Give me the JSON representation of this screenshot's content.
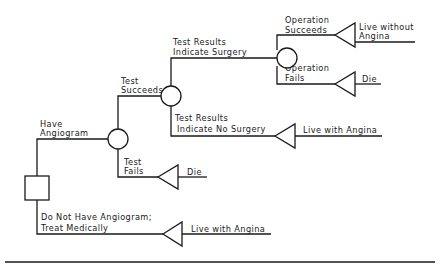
{
  "diagram": {
    "type": "decision-tree",
    "nodes": {
      "decision": {
        "shape": "square",
        "label": ""
      },
      "chance_angiogram": {
        "shape": "circle"
      },
      "chance_test_result": {
        "shape": "circle"
      },
      "chance_operation": {
        "shape": "circle"
      }
    },
    "branches": {
      "have_angiogram": {
        "line1": "Have",
        "line2": "Angiogram"
      },
      "no_angiogram": {
        "line1": "Do Not Have Angiogram;",
        "line2": "Treat Medically"
      },
      "test_succeeds": {
        "line1": "Test",
        "line2": "Succeeds"
      },
      "test_fails": {
        "line1": "Test",
        "line2": "Fails"
      },
      "indicate_surgery": {
        "line1": "Test Results",
        "line2": "Indicate Surgery"
      },
      "indicate_no_surgery": {
        "line1": "Test Results",
        "line2": "Indicate No Surgery"
      },
      "operation_succeeds": {
        "line1": "Operation",
        "line2": "Succeeds"
      },
      "operation_fails": {
        "line1": "Operation",
        "line2": "Fails"
      }
    },
    "outcomes": {
      "live_without_angina": {
        "line1": "Live without",
        "line2": "Angina"
      },
      "die_operation": {
        "label": "Die"
      },
      "live_with_angina_no_surgery": {
        "label": "Live with Angina"
      },
      "die_test": {
        "label": "Die"
      },
      "live_with_angina_medical": {
        "label": "Live with Angina"
      }
    }
  }
}
